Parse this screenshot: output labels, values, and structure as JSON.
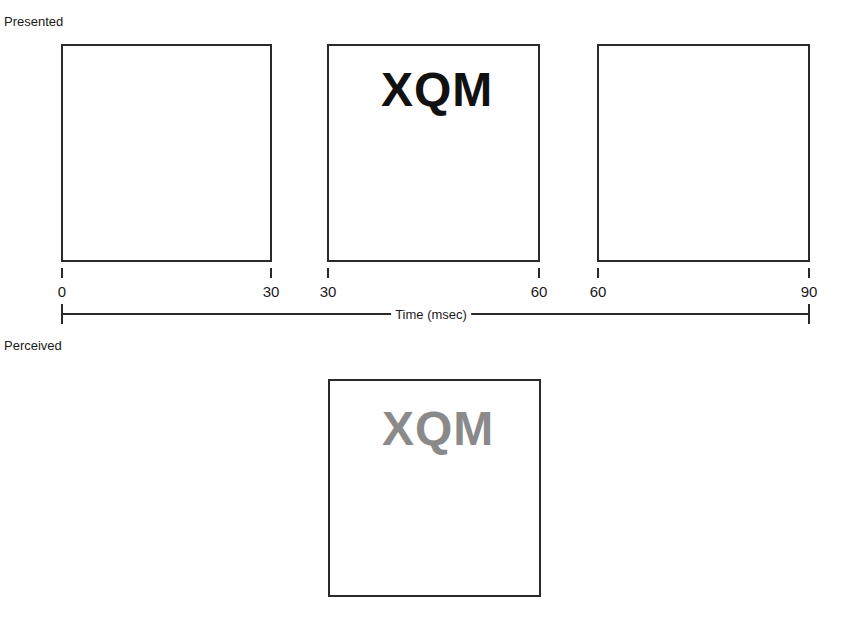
{
  "presented": {
    "label": "Presented",
    "frames": [
      {
        "start": "0",
        "end": "30",
        "content": ""
      },
      {
        "start": "30",
        "end": "60",
        "content": "XQM"
      },
      {
        "start": "60",
        "end": "90",
        "content": ""
      }
    ],
    "stimulus_color": "#111111"
  },
  "time_axis": {
    "label": "Time (msec)",
    "start": "0",
    "end": "90"
  },
  "perceived": {
    "label": "Perceived",
    "content": "XQM",
    "stimulus_color": "#8a8a8a"
  }
}
